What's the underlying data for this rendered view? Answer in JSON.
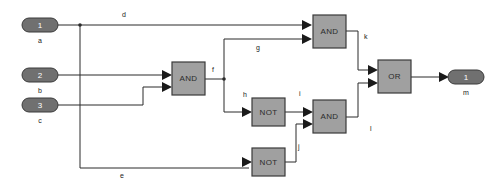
{
  "diagram": {
    "colors": {
      "gate_fill": "#a0a0a0",
      "gate_stroke": "#3a3a3a",
      "terminal_fill": "#707070",
      "wire": "#2b2b2b",
      "background": "#ffffff"
    },
    "inputs": [
      {
        "id": "in-a",
        "number": "1",
        "label": "a",
        "x": 40,
        "y": 25
      },
      {
        "id": "in-b",
        "number": "2",
        "label": "b",
        "x": 40,
        "y": 75
      },
      {
        "id": "in-c",
        "number": "3",
        "label": "c",
        "x": 40,
        "y": 105
      }
    ],
    "outputs": [
      {
        "id": "out-m",
        "number": "1",
        "label": "m",
        "x": 466,
        "y": 77
      }
    ],
    "gates": [
      {
        "id": "gate-and-1",
        "type": "AND",
        "label": "AND",
        "x": 172,
        "y": 62,
        "w": 33,
        "h": 33
      },
      {
        "id": "gate-and-top",
        "type": "AND",
        "label": "AND",
        "x": 313,
        "y": 15,
        "w": 33,
        "h": 33
      },
      {
        "id": "gate-not-1",
        "type": "NOT",
        "label": "NOT",
        "x": 252,
        "y": 98,
        "w": 33,
        "h": 28
      },
      {
        "id": "gate-not-2",
        "type": "NOT",
        "label": "NOT",
        "x": 252,
        "y": 148,
        "w": 33,
        "h": 28
      },
      {
        "id": "gate-and-bottom",
        "type": "AND",
        "label": "AND",
        "x": 313,
        "y": 100,
        "w": 33,
        "h": 33
      },
      {
        "id": "gate-or",
        "type": "OR",
        "label": "OR",
        "x": 378,
        "y": 60,
        "w": 33,
        "h": 33
      }
    ],
    "wire_labels": [
      {
        "id": "wire-d",
        "label": "d",
        "x": 122,
        "y": 17
      },
      {
        "id": "wire-e",
        "label": "e",
        "x": 120,
        "y": 178
      },
      {
        "id": "wire-f",
        "label": "f",
        "x": 212,
        "y": 72
      },
      {
        "id": "wire-g",
        "label": "g",
        "x": 256,
        "y": 50
      },
      {
        "id": "wire-h",
        "label": "h",
        "x": 243,
        "y": 97
      },
      {
        "id": "wire-i",
        "label": "i",
        "x": 299,
        "y": 96
      },
      {
        "id": "wire-j",
        "label": "j",
        "x": 298,
        "y": 149
      },
      {
        "id": "wire-k",
        "label": "k",
        "x": 364,
        "y": 39
      },
      {
        "id": "wire-l",
        "label": "l",
        "x": 370,
        "y": 131
      }
    ]
  }
}
